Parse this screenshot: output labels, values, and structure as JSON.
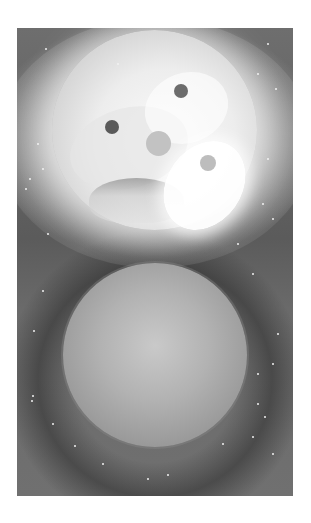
{
  "artwork": {
    "description": "Grayscale space illustration: a bright glowing moon with a face-like pattern above a dimmer sphere surrounded by a dark halo and scattered stars",
    "colors": {
      "background": "#ffffff",
      "space": "#5b5b5b",
      "glow": "#fafafa",
      "lower_sphere": "#b2b2b2"
    }
  }
}
